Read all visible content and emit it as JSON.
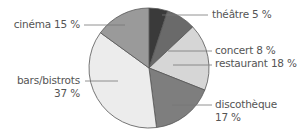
{
  "chart_data": {
    "type": "pie",
    "title": "",
    "start_angle_deg": 0,
    "direction": "clockwise",
    "slices": [
      {
        "label": "théâtre",
        "value": 5,
        "display": "théâtre 5 %",
        "color": "#3a3a3a"
      },
      {
        "label": "concert",
        "value": 8,
        "display": "concert 8 %",
        "color": "#6a6a6a"
      },
      {
        "label": "restaurant",
        "value": 18,
        "display": "restaurant 18 %",
        "color": "#d6d6d6"
      },
      {
        "label": "discothèque",
        "value": 17,
        "display": "discothèque 17 %",
        "color": "#7e7e7e"
      },
      {
        "label": "bars/bistrots",
        "value": 37,
        "display": "bars/bistrots 37 %",
        "color": "#ececec"
      },
      {
        "label": "cinéma",
        "value": 15,
        "display": "cinéma 15 %",
        "color": "#9a9a9a"
      }
    ],
    "categories": [
      "théâtre",
      "concert",
      "restaurant",
      "discothèque",
      "bars/bistrots",
      "cinéma"
    ],
    "values": [
      5,
      8,
      18,
      17,
      37,
      15
    ],
    "unit": "%",
    "legend": "none (leader-line labels)"
  },
  "labels": {
    "theatre": "théâtre 5 %",
    "concert": "concert 8 %",
    "restaurant": "restaurant 18 %",
    "discotheque_name": "discothèque",
    "discotheque_value": "17 %",
    "bars_name": "bars/bistrots",
    "bars_value": "37 %",
    "cinema": "cinéma 15 %"
  }
}
